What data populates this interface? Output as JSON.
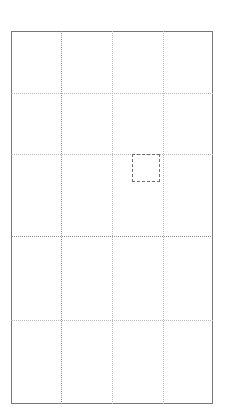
{
  "canvas": {
    "width": 229,
    "height": 419,
    "background_color": "#ffffff",
    "label": "layout-grid-canvas"
  },
  "artboard": {
    "label": "artboard",
    "x": 11,
    "y": 31,
    "width": 202,
    "height": 373,
    "border_color": "#777777",
    "fill_color": "#ffffff"
  },
  "grid": {
    "line_style": "dotted",
    "color": "#b9b9b9",
    "strong_color": "#8e8e8e",
    "vertical_guides": [
      {
        "label": "vertical-guide-1",
        "x": 61,
        "strong": true
      },
      {
        "label": "vertical-guide-2",
        "x": 112,
        "strong": false
      },
      {
        "label": "vertical-guide-3",
        "x": 163,
        "strong": false
      }
    ],
    "horizontal_guides": [
      {
        "label": "horizontal-guide-1",
        "y": 93,
        "strong": false
      },
      {
        "label": "horizontal-guide-2",
        "y": 154,
        "strong": false
      },
      {
        "label": "horizontal-guide-3",
        "y": 236,
        "strong": true
      },
      {
        "label": "horizontal-guide-4",
        "y": 320,
        "strong": false
      }
    ],
    "columns": 4,
    "rows": 5
  },
  "selection": {
    "label": "selection-box",
    "x": 132,
    "y": 154,
    "width": 28,
    "height": 28,
    "border_color": "#6f6f6f",
    "border_style": "dashed"
  }
}
